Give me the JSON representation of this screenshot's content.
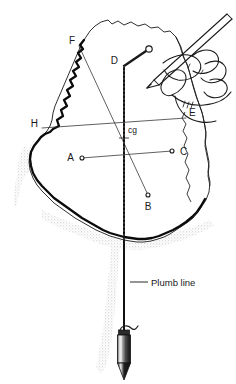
{
  "figure": {
    "background_color": "#ffffff",
    "ink_color": "#1a1a1a",
    "shadow_color": "#c9c9c9",
    "outline_color": "#111111"
  },
  "labels": {
    "A": "A",
    "B": "B",
    "C": "C",
    "D": "D",
    "E": "E",
    "F": "F",
    "H": "H",
    "cg": "cg",
    "plumb_line": "Plumb line"
  },
  "points": [
    {
      "id": "A",
      "label": "A",
      "x": 82,
      "y": 158,
      "marker": "open-circle"
    },
    {
      "id": "B",
      "label": "B",
      "x": 148,
      "y": 195,
      "marker": "open-circle"
    },
    {
      "id": "C",
      "label": "C",
      "x": 172,
      "y": 151,
      "marker": "open-circle"
    },
    {
      "id": "D",
      "label": "D",
      "x": 124,
      "y": 66,
      "marker": "none"
    },
    {
      "id": "E",
      "label": "E",
      "x": 186,
      "y": 118,
      "marker": "none"
    },
    {
      "id": "F",
      "label": "F",
      "x": 79,
      "y": 46,
      "marker": "none"
    },
    {
      "id": "H",
      "label": "H",
      "x": 42,
      "y": 128,
      "marker": "none"
    },
    {
      "id": "cg",
      "label": "cg",
      "x": 124,
      "y": 138,
      "marker": "cross"
    }
  ],
  "suspension": {
    "pin_x": 149,
    "pin_y": 49,
    "pin_radius": 3.2,
    "from_point": "D"
  },
  "plumb_bob": {
    "x": 124,
    "top_y": 328,
    "tip_y": 372,
    "body_width": 13
  },
  "annotation_leader": {
    "from_x": 130,
    "from_y": 282,
    "to_x": 148,
    "to_y": 282
  }
}
